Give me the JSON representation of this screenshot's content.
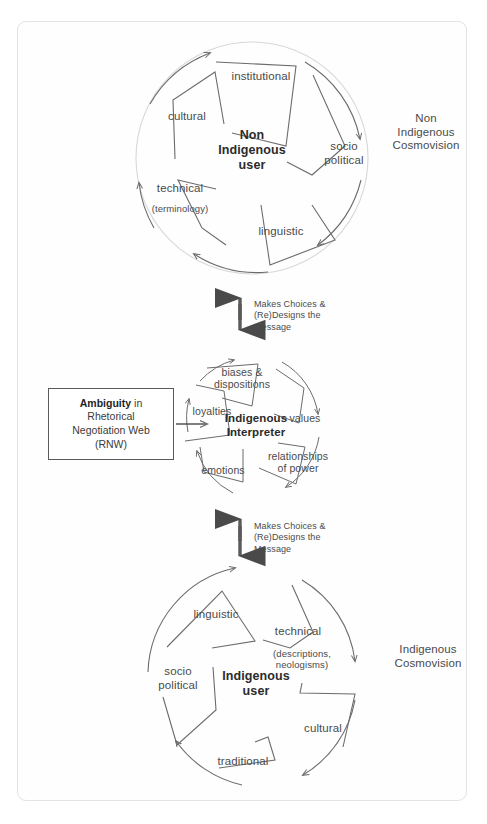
{
  "diagram": {
    "frame_color": "#e3e3e3",
    "line_color": "#6b6b6b",
    "text_color": "#4a4a4a"
  },
  "top_circle": {
    "core_label": "Non\nIndigenous\nuser",
    "side_label": "Non\nIndigenous\nCosmovision",
    "segments": [
      {
        "label": "institutional",
        "sub": ""
      },
      {
        "label": "socio\npolitical",
        "sub": ""
      },
      {
        "label": "linguistic",
        "sub": ""
      },
      {
        "label": "technical",
        "sub": "(terminology)"
      },
      {
        "label": "cultural",
        "sub": ""
      }
    ]
  },
  "middle_circle": {
    "core_label": "Indigenous\nInterpreter",
    "segments": [
      {
        "label": "biases &\ndispositions",
        "sub": ""
      },
      {
        "label": "values",
        "sub": ""
      },
      {
        "label": "relationships\nof power",
        "sub": ""
      },
      {
        "label": "emotions",
        "sub": ""
      },
      {
        "label": "loyalties",
        "sub": ""
      }
    ]
  },
  "bottom_circle": {
    "core_label": "Indigenous\nuser",
    "side_label": "Indigenous\nCosmovision",
    "segments": [
      {
        "label": "linguistic",
        "sub": ""
      },
      {
        "label": "technical",
        "sub": "(descriptions,\nneologisms)"
      },
      {
        "label": "cultural",
        "sub": ""
      },
      {
        "label": "traditional",
        "sub": ""
      },
      {
        "label": "socio\npolitical",
        "sub": ""
      }
    ]
  },
  "rnw_box": {
    "emphasis": "Ambiguity",
    "rest_line1": " in",
    "line2": "Rhetorical",
    "line3": "Negotiation Web",
    "line4": "(RNW)"
  },
  "connector_top": {
    "text": "Makes Choices &\n(Re)Designs the\nMessage"
  },
  "connector_bottom": {
    "text": "Makes Choices &\n(Re)Designs the\nMessage"
  }
}
